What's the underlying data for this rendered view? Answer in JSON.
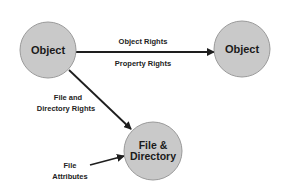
{
  "colors": {
    "node_fill": "#c9c9c9",
    "node_stroke": "#9a9a9a",
    "line": "#1e1e1e",
    "text": "#1a1a1a"
  },
  "nodes": {
    "object_left": {
      "label": "Object"
    },
    "object_right": {
      "label": "Object"
    },
    "file_directory": {
      "label_line1": "File &",
      "label_line2": "Directory"
    }
  },
  "edges": {
    "object_to_object": {
      "label_top": "Object Rights",
      "label_bottom": "Property Rights"
    },
    "object_to_file": {
      "label_line1": "File and",
      "label_line2": "Directory Rights"
    },
    "attributes_to_file": {
      "label_line1": "File",
      "label_line2": "Attributes"
    }
  }
}
